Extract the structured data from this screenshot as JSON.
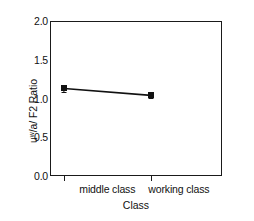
{
  "chart_data": {
    "type": "line",
    "title": "",
    "subtitle": "",
    "xlabel": "Class",
    "ylabel": "uʷ/a/ F2 Ratio",
    "ylabel_plain": "u/-/a/ F2 Ratio",
    "categories": [
      "middle class",
      "working class"
    ],
    "values": [
      1.13,
      1.04
    ],
    "errors": [
      0.04,
      0.03
    ],
    "ylim": [
      0.0,
      2.0
    ],
    "yticks": [
      "0.0",
      "0.5",
      "1.0",
      "1.5",
      "2.0"
    ],
    "ytick_values": [
      0.0,
      0.5,
      1.0,
      1.5,
      2.0
    ],
    "xtick_labels": [
      "middle class",
      "working class"
    ],
    "grid": false,
    "legend": false,
    "legend_position": "none",
    "marker": "square",
    "series": [
      {
        "name": "uʷ/a/ F2 Ratio",
        "values": [
          1.13,
          1.04
        ]
      }
    ],
    "colors": {
      "line": "#111111",
      "marker": "#111111",
      "axis": "#1a1a1a",
      "background": "#ffffff",
      "text": "#111111"
    }
  }
}
